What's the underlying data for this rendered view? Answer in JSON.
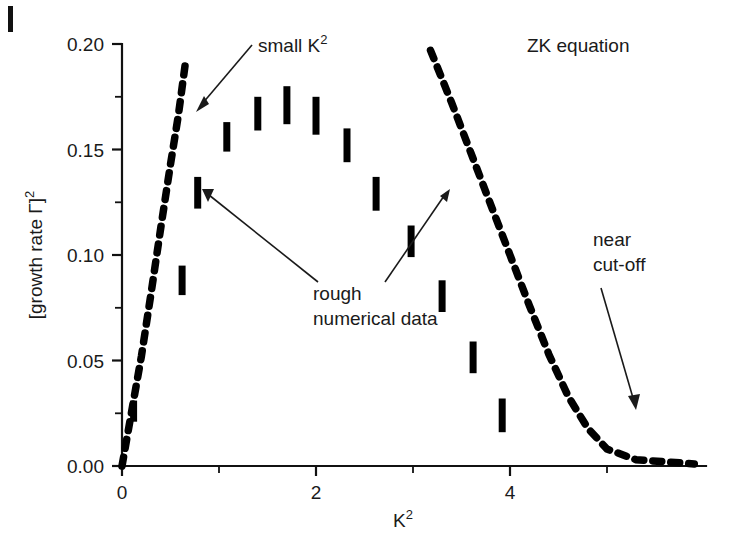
{
  "figure": {
    "background_color": "#ffffff",
    "ink_color": "#000000",
    "corner_mark": "|"
  },
  "chart_data": {
    "type": "scatter",
    "title": "",
    "xlabel": "K²",
    "ylabel": "[growth rate Γ]²",
    "xlim": [
      -0.15,
      6.1
    ],
    "ylim": [
      0.0,
      0.205
    ],
    "grid": false,
    "legend_position": "none",
    "x_ticks": [
      "0",
      "2",
      "4"
    ],
    "x_tick_values": [
      0,
      2,
      4
    ],
    "x_minor_tick_values": [
      1,
      3,
      5
    ],
    "y_ticks": [
      "0.00",
      "0.05",
      "0.10",
      "0.15",
      "0.20"
    ],
    "y_tick_values": [
      0.0,
      0.05,
      0.1,
      0.15,
      0.2
    ],
    "y_minor_tick_values": [
      0.025,
      0.075,
      0.125,
      0.175
    ],
    "series": [
      {
        "name": "rough numerical data",
        "style": "vertical error bars",
        "marker": "thick vertical segment",
        "points": [
          {
            "x": 0.12,
            "y_low": 0.021,
            "y_high": 0.031,
            "y": 0.026
          },
          {
            "x": 0.62,
            "y_low": 0.081,
            "y_high": 0.095,
            "y": 0.088
          },
          {
            "x": 0.78,
            "y_low": 0.122,
            "y_high": 0.137,
            "y": 0.13
          },
          {
            "x": 1.08,
            "y_low": 0.149,
            "y_high": 0.163,
            "y": 0.156
          },
          {
            "x": 1.4,
            "y_low": 0.159,
            "y_high": 0.175,
            "y": 0.167
          },
          {
            "x": 1.7,
            "y_low": 0.162,
            "y_high": 0.18,
            "y": 0.171
          },
          {
            "x": 2.0,
            "y_low": 0.157,
            "y_high": 0.175,
            "y": 0.166
          },
          {
            "x": 2.32,
            "y_low": 0.144,
            "y_high": 0.16,
            "y": 0.152
          },
          {
            "x": 2.62,
            "y_low": 0.121,
            "y_high": 0.137,
            "y": 0.129
          },
          {
            "x": 2.98,
            "y_low": 0.099,
            "y_high": 0.114,
            "y": 0.107
          },
          {
            "x": 3.3,
            "y_low": 0.073,
            "y_high": 0.088,
            "y": 0.08
          },
          {
            "x": 3.62,
            "y_low": 0.044,
            "y_high": 0.059,
            "y": 0.051
          },
          {
            "x": 3.92,
            "y_low": 0.016,
            "y_high": 0.032,
            "y": 0.024
          }
        ]
      },
      {
        "name": "ZK equation small-K² branch",
        "style": "dashed curve",
        "points": [
          {
            "x": 0.0,
            "y": 0.0
          },
          {
            "x": 0.1,
            "y": 0.026
          },
          {
            "x": 0.2,
            "y": 0.052
          },
          {
            "x": 0.3,
            "y": 0.082
          },
          {
            "x": 0.4,
            "y": 0.113
          },
          {
            "x": 0.5,
            "y": 0.143
          },
          {
            "x": 0.58,
            "y": 0.166
          },
          {
            "x": 0.65,
            "y": 0.19
          }
        ]
      },
      {
        "name": "ZK equation near cut-off branch",
        "style": "dashed curve",
        "points": [
          {
            "x": 3.18,
            "y": 0.197
          },
          {
            "x": 3.4,
            "y": 0.172
          },
          {
            "x": 3.6,
            "y": 0.148
          },
          {
            "x": 3.8,
            "y": 0.124
          },
          {
            "x": 4.0,
            "y": 0.1
          },
          {
            "x": 4.2,
            "y": 0.076
          },
          {
            "x": 4.4,
            "y": 0.053
          },
          {
            "x": 4.6,
            "y": 0.033
          },
          {
            "x": 4.8,
            "y": 0.018
          },
          {
            "x": 5.0,
            "y": 0.008
          },
          {
            "x": 5.3,
            "y": 0.003
          },
          {
            "x": 5.9,
            "y": 0.001
          }
        ]
      }
    ],
    "annotations": [
      {
        "id": "small-k2",
        "text": "small K",
        "superscript": "2",
        "target_x": 0.6,
        "target_y": 0.167
      },
      {
        "id": "zk-equation",
        "text": "ZK equation",
        "superscript": "",
        "target_x": null,
        "target_y": null
      },
      {
        "id": "rough-numerical-data",
        "line1": "rough",
        "line2": "numerical data",
        "target_x_a": 0.8,
        "target_y_a": 0.126,
        "target_x_b": 2.58,
        "target_y_b": 0.127
      },
      {
        "id": "near-cut-off",
        "line1": "near",
        "line2": "cut-off",
        "target_x": 4.42,
        "target_y": 0.044
      }
    ]
  },
  "labels": {
    "y_axis_title_prefix": "[growth rate Γ]",
    "y_axis_title_sup": "2",
    "x_axis_title_prefix": "K",
    "x_axis_title_sup": "2",
    "small_k2_prefix": "small K",
    "small_k2_sup": "2",
    "zk_equation": "ZK equation",
    "rough_line1": "rough",
    "rough_line2": "numerical data",
    "cutoff_line1": "near",
    "cutoff_line2": "cut-off",
    "y_tick_0": "0.00",
    "y_tick_1": "0.05",
    "y_tick_2": "0.10",
    "y_tick_3": "0.15",
    "y_tick_4": "0.20",
    "x_tick_0": "0",
    "x_tick_1": "2",
    "x_tick_2": "4"
  }
}
